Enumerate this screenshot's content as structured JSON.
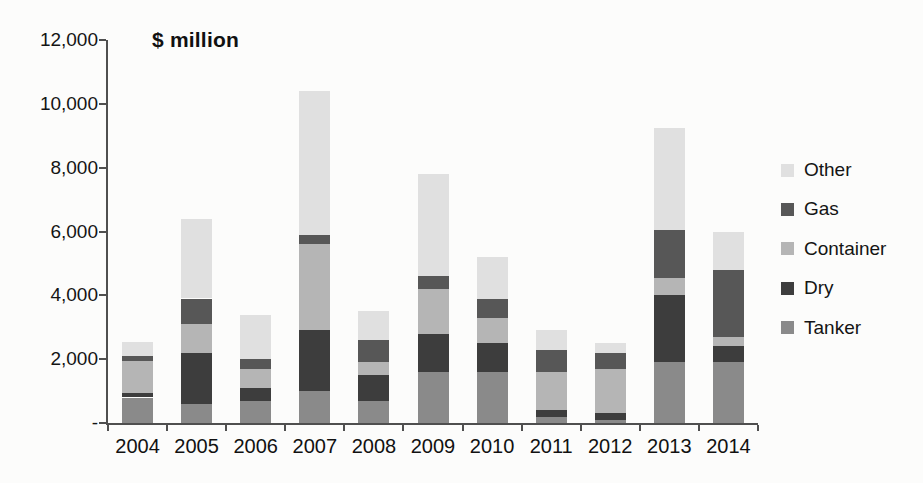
{
  "chart_data": {
    "type": "bar",
    "stacked": true,
    "title": "$ million",
    "xlabel": "",
    "ylabel": "$ million",
    "ylim": [
      0,
      12000
    ],
    "grid": "off",
    "legend_position": "right",
    "categories": [
      "2004",
      "2005",
      "2006",
      "2007",
      "2008",
      "2009",
      "2010",
      "2011",
      "2012",
      "2013",
      "2014"
    ],
    "series": [
      {
        "name": "Tanker",
        "color": "#8a8a8a",
        "values": [
          800,
          600,
          700,
          1000,
          700,
          1600,
          1600,
          200,
          100,
          1900,
          1900
        ]
      },
      {
        "name": "Dry",
        "color": "#3d3d3d",
        "values": [
          150,
          1600,
          400,
          1900,
          800,
          1200,
          900,
          200,
          200,
          2100,
          500
        ]
      },
      {
        "name": "Container",
        "color": "#b5b5b5",
        "values": [
          1000,
          900,
          600,
          2700,
          400,
          1400,
          800,
          1200,
          1400,
          550,
          300
        ]
      },
      {
        "name": "Gas",
        "color": "#575757",
        "values": [
          150,
          800,
          300,
          300,
          700,
          400,
          600,
          700,
          500,
          1500,
          2100
        ]
      },
      {
        "name": "Other",
        "color": "#e0e0e0",
        "values": [
          450,
          2500,
          1400,
          4500,
          900,
          3200,
          1300,
          600,
          300,
          3200,
          1200
        ]
      }
    ],
    "legend_order": [
      "Other",
      "Gas",
      "Container",
      "Dry",
      "Tanker"
    ],
    "y_ticks": [
      {
        "value": 0,
        "label": "-"
      },
      {
        "value": 2000,
        "label": "2,000"
      },
      {
        "value": 4000,
        "label": "4,000"
      },
      {
        "value": 6000,
        "label": "6,000"
      },
      {
        "value": 8000,
        "label": "8,000"
      },
      {
        "value": 10000,
        "label": "10,000"
      },
      {
        "value": 12000,
        "label": "12,000"
      }
    ]
  }
}
